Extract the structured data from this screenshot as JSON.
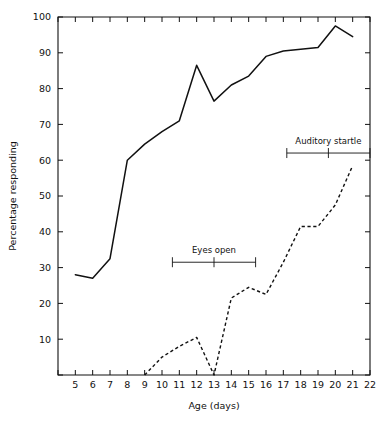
{
  "chart_data": {
    "type": "line",
    "title": "",
    "xlabel": "Age (days)",
    "ylabel": "Percentage responding",
    "xlim": [
      4,
      22
    ],
    "ylim": [
      0,
      100
    ],
    "grid": false,
    "legend": "none",
    "xticks": [
      4,
      5,
      6,
      7,
      8,
      9,
      10,
      11,
      12,
      13,
      14,
      15,
      16,
      17,
      18,
      19,
      20,
      21,
      22
    ],
    "xticklabels": [
      "",
      "5",
      "6",
      "7",
      "8",
      "9",
      "10",
      "11",
      "12",
      "13",
      "14",
      "15",
      "16",
      "17",
      "18",
      "19",
      "20",
      "21",
      "22"
    ],
    "yticks": [
      0,
      10,
      20,
      30,
      40,
      50,
      60,
      70,
      80,
      90,
      100
    ],
    "yticklabels": [
      "",
      "10",
      "20",
      "30",
      "40",
      "50",
      "60",
      "70",
      "80",
      "90",
      "100"
    ],
    "series": [
      {
        "name": "solid-curve",
        "style": "solid",
        "x": [
          5,
          6,
          7,
          8,
          9,
          10,
          11,
          12,
          13,
          14,
          15,
          16,
          17,
          18,
          19,
          20,
          21
        ],
        "values": [
          28,
          27,
          32.5,
          60,
          64.5,
          68,
          71,
          86.5,
          76.5,
          81,
          83.5,
          89,
          90.5,
          91,
          91.5,
          97.5,
          94.5
        ]
      },
      {
        "name": "dashed-curve",
        "style": "dashed",
        "x": [
          9,
          10,
          11,
          12,
          13,
          14,
          15,
          16,
          17,
          18,
          19,
          20,
          21
        ],
        "values": [
          0,
          5,
          8,
          10.5,
          0,
          21.5,
          24.5,
          22.5,
          31.5,
          41.5,
          41.5,
          47.5,
          58.5
        ]
      }
    ],
    "annotations": [
      {
        "label": "Eyes open",
        "x_start": 10.6,
        "x_center": 13.0,
        "x_end": 15.4,
        "y": 31.5
      },
      {
        "label": "Auditory startle",
        "x_start": 17.2,
        "x_center": 19.6,
        "x_end": 22.0,
        "y": 62.0
      }
    ]
  }
}
